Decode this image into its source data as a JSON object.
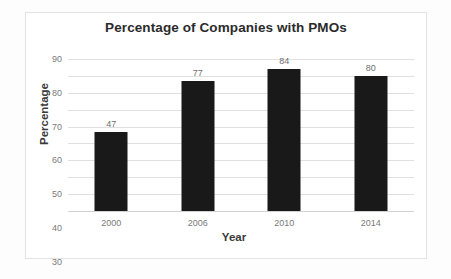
{
  "chart_data": {
    "type": "bar",
    "title": "Percentage of Companies with PMOs",
    "xlabel": "Year",
    "ylabel": "Percentage",
    "categories": [
      "2000",
      "2006",
      "2010",
      "2014"
    ],
    "values": [
      47,
      77,
      84,
      80
    ],
    "value_labels": [
      "47",
      "77",
      "84",
      "80"
    ],
    "ylim": [
      0,
      90
    ],
    "ytick_values": [
      90,
      80,
      70,
      60,
      50,
      40,
      30,
      20,
      10,
      0
    ],
    "ytick_labels": [
      "90",
      "80",
      "70",
      "60",
      "50",
      "40",
      "30",
      "20",
      "10",
      "0"
    ],
    "grid": true,
    "grid_axis": "y",
    "legend": false,
    "legend_position": "none",
    "bar_color": "#191919",
    "gridline_color": "#e0e0e0",
    "axis_text_color": "#7a7a7a",
    "title_color": "#2b2b2b",
    "plot_background": "#ffffff",
    "figure_background": "#fdfdfd",
    "frame_border_color": "#e3e3e3"
  }
}
